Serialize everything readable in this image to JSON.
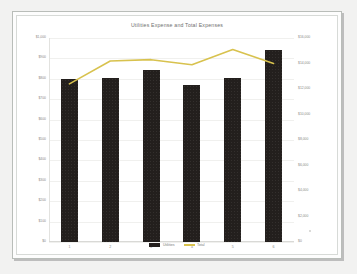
{
  "chart_data": {
    "type": "bar",
    "title": "Utilities Expense and Total Expenses",
    "xlabel": "",
    "ylabel": "",
    "grid": true,
    "legend_position": "bottom",
    "categories": [
      "1",
      "2",
      "3",
      "4",
      "5",
      "6"
    ],
    "series": [
      {
        "name": "Utilities",
        "type": "bar",
        "axis": "left",
        "color": "#231f1d",
        "values": [
          800,
          805,
          845,
          770,
          805,
          940
        ]
      },
      {
        "name": "Total",
        "type": "line",
        "axis": "right",
        "color": "#d8c24e",
        "values": [
          12400,
          14200,
          14300,
          13900,
          15100,
          14000
        ]
      }
    ],
    "ylim_left": [
      0,
      1000
    ],
    "ylim_right": [
      0,
      16000
    ],
    "yticks_left": [
      {
        "value": 1000,
        "label": "$1,000"
      },
      {
        "value": 900,
        "label": "$900"
      },
      {
        "value": 800,
        "label": "$800"
      },
      {
        "value": 700,
        "label": "$700"
      },
      {
        "value": 600,
        "label": "$600"
      },
      {
        "value": 500,
        "label": "$500"
      },
      {
        "value": 400,
        "label": "$400"
      },
      {
        "value": 300,
        "label": "$300"
      },
      {
        "value": 200,
        "label": "$200"
      },
      {
        "value": 100,
        "label": "$100"
      },
      {
        "value": 0,
        "label": "$0"
      }
    ],
    "yticks_right": [
      {
        "value": 16000,
        "label": "$16,000"
      },
      {
        "value": 14000,
        "label": "$14,000"
      },
      {
        "value": 12000,
        "label": "$12,000"
      },
      {
        "value": 10000,
        "label": "$10,000"
      },
      {
        "value": 8000,
        "label": "$8,000"
      },
      {
        "value": 6000,
        "label": "$6,000"
      },
      {
        "value": 4000,
        "label": "$4,000"
      },
      {
        "value": 2000,
        "label": "$2,000"
      },
      {
        "value": 0,
        "label": "$0"
      }
    ]
  },
  "legend": {
    "items": [
      {
        "label": "Utilities",
        "icon": "bar-swatch"
      },
      {
        "label": "Total",
        "icon": "line-swatch"
      }
    ]
  }
}
